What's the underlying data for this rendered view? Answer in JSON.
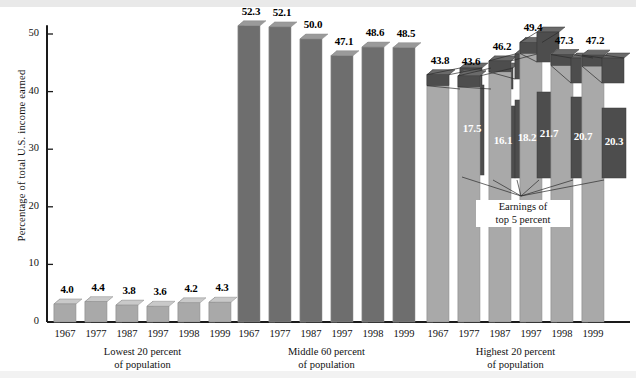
{
  "chart_data": {
    "type": "bar",
    "title": "",
    "xlabel": "",
    "ylabel": "Percentage of total U.S. income earned",
    "ylim": [
      0,
      52
    ],
    "yticks": [
      0,
      10,
      20,
      30,
      40,
      50
    ],
    "ytick_labels": [
      "0",
      "10",
      "20",
      "30",
      "40",
      "50"
    ],
    "grid": false,
    "legend": "none",
    "categories": [
      "1967",
      "1977",
      "1987",
      "1997",
      "1998",
      "1999"
    ],
    "groups": [
      {
        "name": "Lowest 20 percent of population",
        "label_line1": "Lowest 20 percent",
        "label_line2": "of population",
        "style": "light",
        "values": [
          4.0,
          4.4,
          3.8,
          3.6,
          4.2,
          4.3
        ],
        "value_labels": [
          "4.0",
          "4.4",
          "3.8",
          "3.6",
          "4.2",
          "4.3"
        ]
      },
      {
        "name": "Middle 60 percent of population",
        "label_line1": "Middle 60 percent",
        "label_line2": "of population",
        "style": "dark",
        "values": [
          52.3,
          52.1,
          50.0,
          47.1,
          48.6,
          48.5
        ],
        "value_labels": [
          "52.3",
          "52.1",
          "50.0",
          "47.1",
          "48.6",
          "48.5"
        ]
      },
      {
        "name": "Highest 20 percent of population",
        "label_line1": "Highest 20 percent",
        "label_line2": "of population",
        "style": "light-with-inset",
        "values": [
          43.8,
          43.6,
          46.2,
          49.4,
          47.3,
          47.2
        ],
        "value_labels": [
          "43.8",
          "43.6",
          "46.2",
          "49.4",
          "47.3",
          "47.2"
        ],
        "inset_series_name": "Earnings of top 5 percent",
        "inset_values": [
          17.5,
          16.1,
          18.2,
          21.7,
          20.7,
          20.3
        ],
        "inset_value_labels": [
          "17.5",
          "16.1",
          "18.2",
          "21.7",
          "20.7",
          "20.3"
        ]
      }
    ],
    "annotation": {
      "line1": "Earnings of",
      "line2": "top 5 percent"
    }
  },
  "colors": {
    "bar_light_face": "#a9a9a9",
    "bar_light_edge": "#c9c9c9",
    "bar_dark_face": "#6e6e6e",
    "bar_dark_edge": "#9a9a9a",
    "inset_face": "#4d4d4d",
    "inset_edge": "#6a6a6a",
    "axis": "#1a1a1a",
    "text": "#111111",
    "background": "#ffffff",
    "band": "#e9e9e9"
  }
}
